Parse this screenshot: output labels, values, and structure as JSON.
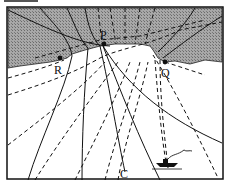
{
  "figure": {
    "type": "wave refraction at a headland",
    "labels": {
      "P": "P",
      "Q": "Q",
      "R": "R",
      "C": "C"
    },
    "legend": {
      "solid_lines": "wave rays (orthogonals)",
      "dashed_lines": "wave crests"
    },
    "regions": [
      "land (shaded)",
      "sea (white)"
    ],
    "objects": [
      "boat"
    ],
    "colors": {
      "land": "#9a9a9a",
      "ink": "#111111",
      "sea": "#ffffff"
    }
  }
}
